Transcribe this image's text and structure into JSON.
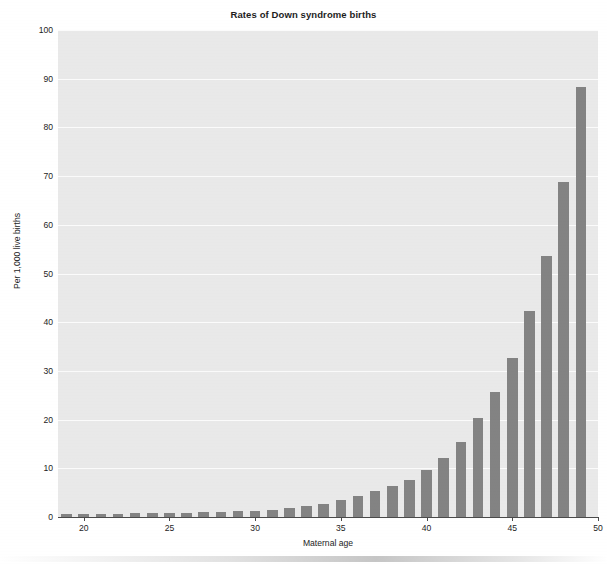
{
  "chart_data": {
    "type": "bar",
    "title": "Rates of Down syndrome births",
    "xlabel": "Maternal age",
    "ylabel": "Per 1,000 live births",
    "xlim": [
      18.5,
      50
    ],
    "ylim": [
      0,
      100
    ],
    "grid": true,
    "legend": false,
    "bar_color": "#838383",
    "plot_background": "#e9e9e9",
    "gridline_color": "#fbfbfb",
    "axis_color": "#4a4a4a",
    "x_tick_labels": [
      "20",
      "25",
      "30",
      "35",
      "40",
      "45",
      "50"
    ],
    "x_ticks": [
      20,
      25,
      30,
      35,
      40,
      45,
      50
    ],
    "y_tick_labels": [
      "0",
      "10",
      "20",
      "30",
      "40",
      "50",
      "60",
      "70",
      "80",
      "90",
      "100"
    ],
    "y_ticks": [
      0,
      10,
      20,
      30,
      40,
      50,
      60,
      70,
      80,
      90,
      100
    ],
    "categories": [
      19,
      20,
      21,
      22,
      23,
      24,
      25,
      26,
      27,
      28,
      29,
      30,
      31,
      32,
      33,
      34,
      35,
      36,
      37,
      38,
      39,
      40,
      41,
      42,
      43,
      44,
      45,
      46,
      47,
      48,
      49
    ],
    "values": [
      0.6,
      0.7,
      0.7,
      0.7,
      0.8,
      0.8,
      0.9,
      0.9,
      1.0,
      1.1,
      1.2,
      1.3,
      1.5,
      1.8,
      2.2,
      2.7,
      3.4,
      4.3,
      5.4,
      6.3,
      7.6,
      9.6,
      12.1,
      15.5,
      20.4,
      25.6,
      32.7,
      42.3,
      53.5,
      68.7,
      88.4
    ]
  },
  "figure": {
    "title": "Rates of Down syndrome births",
    "x_axis_title": "Maternal age",
    "y_axis_title": "Per 1,000 live births"
  }
}
